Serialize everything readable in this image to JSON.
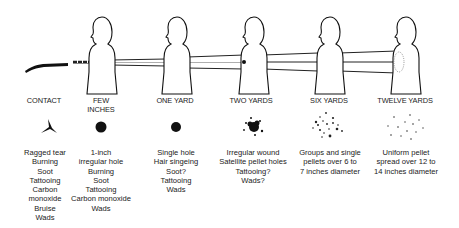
{
  "diagram": {
    "ink_color": "#111111",
    "columns": [
      {
        "id": "contact",
        "label_lines": [
          "CONTACT"
        ],
        "wound_icon": "ragged-tear-icon",
        "description_lines": [
          "Ragged tear",
          "Burning",
          "Soot",
          "Tattooing",
          "Carbon",
          "monoxide",
          "Bruise",
          "Wads"
        ]
      },
      {
        "id": "few-inches",
        "label_lines": [
          "FEW",
          "INCHES"
        ],
        "wound_icon": "irregular-hole-icon",
        "description_lines": [
          "1-inch",
          "irregular hole",
          "Burning",
          "Soot",
          "Tattooing",
          "Carbon monoxide",
          "Wads"
        ]
      },
      {
        "id": "one-yard",
        "label_lines": [
          "ONE YARD"
        ],
        "wound_icon": "single-hole-icon",
        "description_lines": [
          "Single hole",
          "Hair singeing",
          "Soot?",
          "Tattooing",
          "Wads"
        ]
      },
      {
        "id": "two-yards",
        "label_lines": [
          "TWO YARDS"
        ],
        "wound_icon": "satellite-holes-icon",
        "description_lines": [
          "Irregular wound",
          "Satellite pellet holes",
          "Tattooing?",
          "Wads?"
        ]
      },
      {
        "id": "six-yards",
        "label_lines": [
          "SIX YARDS"
        ],
        "wound_icon": "pellet-groups-icon",
        "description_lines": [
          "Groups and single",
          "pellets over 6 to",
          "7 inches diameter"
        ]
      },
      {
        "id": "twelve-yards",
        "label_lines": [
          "TWELVE YARDS"
        ],
        "wound_icon": "uniform-spread-icon",
        "description_lines": [
          "Uniform pellet",
          "spread over 12 to",
          "14 inches diameter"
        ]
      }
    ]
  }
}
